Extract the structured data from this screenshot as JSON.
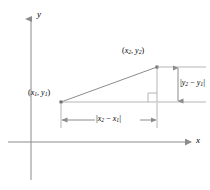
{
  "figure": {
    "background_color": "#ffffff",
    "line_color": "#8c8c8c",
    "axis_color": "#8c8c8c",
    "text_color": "#000000"
  },
  "axes": {
    "y_label": "y",
    "x_label": "x",
    "y_axis": {
      "x": 31,
      "top": 18,
      "bottom": 180,
      "arrow": "up"
    },
    "x_axis": {
      "y": 142,
      "left": 8,
      "right": 192,
      "arrow": "right"
    }
  },
  "points": {
    "p1": {
      "label_open": "(",
      "var_x": "x",
      "sub_x": "1",
      "comma": ", ",
      "var_y": "y",
      "sub_y": "1",
      "label_close": ")",
      "cx": 61,
      "cy": 102
    },
    "p2": {
      "label_open": "(",
      "var_x": "x",
      "sub_x": "2",
      "comma": ", ",
      "var_y": "y",
      "sub_y": "2",
      "label_close": ")",
      "cx": 157,
      "cy": 67
    }
  },
  "dimensions": {
    "horizontal": {
      "name": "horizontal-leg",
      "bar_open": "|",
      "var_a": "x",
      "sub_a": "2",
      "operator": " − ",
      "var_b": "x",
      "sub_b": "1",
      "bar_close": "|",
      "y": 120,
      "from_x": 61,
      "to_x": 157
    },
    "vertical": {
      "name": "vertical-leg",
      "bar_open": "|",
      "var_a": "y",
      "sub_a": "2",
      "operator": " − ",
      "var_b": "y",
      "sub_b": "1",
      "bar_close": "|",
      "x": 178,
      "from_y": 67,
      "to_y": 102
    }
  },
  "right_angle_marker": {
    "name": "right-angle-square",
    "x": 148,
    "y": 93,
    "size": 9
  }
}
